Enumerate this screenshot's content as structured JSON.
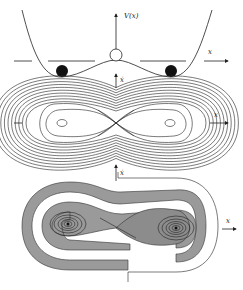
{
  "figure": {
    "panels": [
      {
        "id": "potential",
        "description": "Double-well potential V(x) with balls in wells and unstable top",
        "labels": {
          "y_axis": "V(x)",
          "x_axis": "x"
        },
        "stable_balls": 2,
        "unstable_ball": 1
      },
      {
        "id": "phase-portrait",
        "description": "Phase portrait of double-well oscillator: nested orbits around two centers with separatrix figure-eight",
        "labels": {
          "y_axis": "ẋ",
          "x_axis": "x"
        },
        "centers": 2,
        "saddle": 1
      },
      {
        "id": "basins",
        "description": "Shaded basins of attraction with damped spirals into two foci",
        "labels": {
          "y_axis": "ẋ",
          "x_axis": "x"
        },
        "foci": 2
      }
    ],
    "colors": {
      "ink": "#222222",
      "shade": "#9a9a9a",
      "background": "#ffffff"
    }
  }
}
